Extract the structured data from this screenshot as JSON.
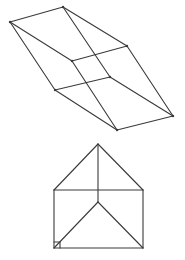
{
  "diagram": {
    "figures": [
      {
        "name": "parallelepiped-wireframe",
        "vertices": {
          "A": [
            10,
            22
          ],
          "B": [
            63,
            7
          ],
          "C": [
            127,
            46
          ],
          "D": [
            173,
            116
          ],
          "E": [
            117,
            130
          ],
          "F": [
            55,
            90
          ],
          "G": [
            72,
            61
          ],
          "H": [
            110,
            77
          ]
        },
        "edges": [
          [
            "A",
            "B"
          ],
          [
            "B",
            "C"
          ],
          [
            "C",
            "D"
          ],
          [
            "D",
            "E"
          ],
          [
            "E",
            "F"
          ],
          [
            "F",
            "A"
          ],
          [
            "A",
            "G"
          ],
          [
            "G",
            "H"
          ],
          [
            "H",
            "C"
          ],
          [
            "B",
            "H"
          ],
          [
            "G",
            "E"
          ],
          [
            "F",
            "H"
          ],
          [
            "H",
            "D"
          ]
        ]
      },
      {
        "name": "triangular-prism-front-view",
        "vertices": {
          "P": [
            98,
            144
          ],
          "L": [
            54,
            190
          ],
          "R": [
            143,
            190
          ],
          "O": [
            98,
            202
          ],
          "BL": [
            54,
            248
          ],
          "BR": [
            143,
            248
          ]
        },
        "edges": [
          [
            "P",
            "L"
          ],
          [
            "P",
            "R"
          ],
          [
            "L",
            "R"
          ],
          [
            "P",
            "O"
          ],
          [
            "L",
            "BL"
          ],
          [
            "R",
            "BR"
          ],
          [
            "BL",
            "BR"
          ],
          [
            "O",
            "BL"
          ],
          [
            "O",
            "BR"
          ]
        ],
        "right_angle_marker": "BL"
      }
    ]
  }
}
